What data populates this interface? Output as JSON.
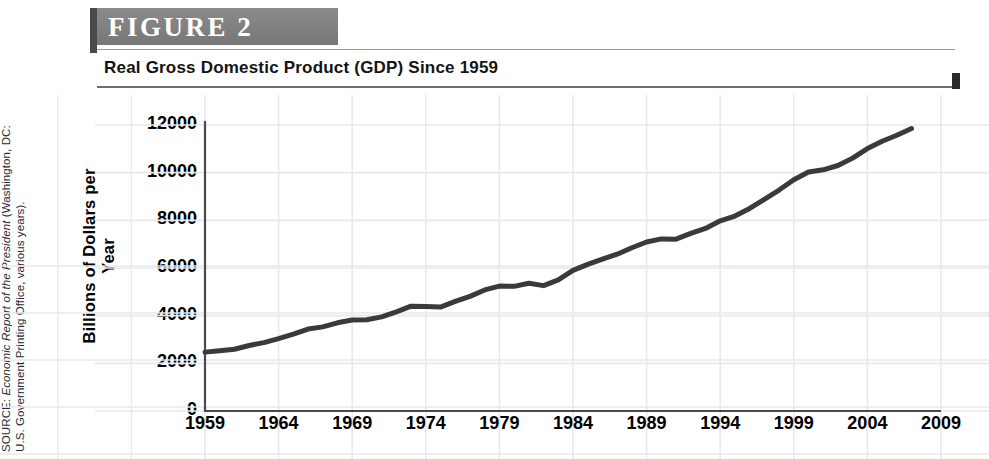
{
  "figure": {
    "badge_label": "FIGURE  2",
    "title": "Real Gross Domestic Product (GDP) Since 1959",
    "source_prefix": "SOURCE: ",
    "source_italic": "Economic Report of the President",
    "source_rest": " (Washington, DC: U.S. Government Printing Office, various years)."
  },
  "colors": {
    "badge_bg": "#818181",
    "badge_edge": "#4a4a4a",
    "line": "#3a3a3a",
    "axis": "#4a4a4a",
    "grid": "#e8e8ee",
    "text": "#000000"
  },
  "chart_data": {
    "type": "line",
    "title": "Real Gross Domestic Product (GDP) Since 1959",
    "xlabel": "",
    "ylabel": "Billions of Dollars per Year",
    "xlim": [
      1959,
      2009
    ],
    "ylim": [
      0,
      12000
    ],
    "xticks": [
      1959,
      1964,
      1969,
      1974,
      1979,
      1984,
      1989,
      1994,
      1999,
      2004,
      2009
    ],
    "yticks": [
      0,
      2000,
      4000,
      6000,
      8000,
      10000,
      12000
    ],
    "grid": true,
    "legend": "none",
    "series": [
      {
        "name": "Real GDP",
        "x": [
          1959,
          1960,
          1961,
          1962,
          1963,
          1964,
          1965,
          1966,
          1967,
          1968,
          1969,
          1970,
          1971,
          1972,
          1973,
          1974,
          1975,
          1976,
          1977,
          1978,
          1979,
          1980,
          1981,
          1982,
          1983,
          1984,
          1985,
          1986,
          1987,
          1988,
          1989,
          1990,
          1991,
          1992,
          1993,
          1994,
          1995,
          1996,
          1997,
          1998,
          1999,
          2000,
          2001,
          2002,
          2003,
          2004,
          2005,
          2006,
          2007
        ],
        "values": [
          2470,
          2530,
          2590,
          2750,
          2870,
          3040,
          3230,
          3440,
          3530,
          3700,
          3820,
          3830,
          3950,
          4160,
          4400,
          4380,
          4360,
          4600,
          4810,
          5080,
          5240,
          5230,
          5360,
          5260,
          5500,
          5900,
          6150,
          6370,
          6580,
          6850,
          7090,
          7220,
          7210,
          7450,
          7660,
          7980,
          8180,
          8500,
          8880,
          9270,
          9700,
          10030,
          10120,
          10300,
          10610,
          11010,
          11320,
          11570,
          11850
        ]
      }
    ],
    "annotations": [
      {
        "label": "1974-75 plateau",
        "x": 1974,
        "y": 4380
      },
      {
        "label": "1980-82 plateau",
        "x": 1981,
        "y": 5300
      },
      {
        "label": "1990-91 plateau",
        "x": 1990,
        "y": 7215
      }
    ]
  }
}
